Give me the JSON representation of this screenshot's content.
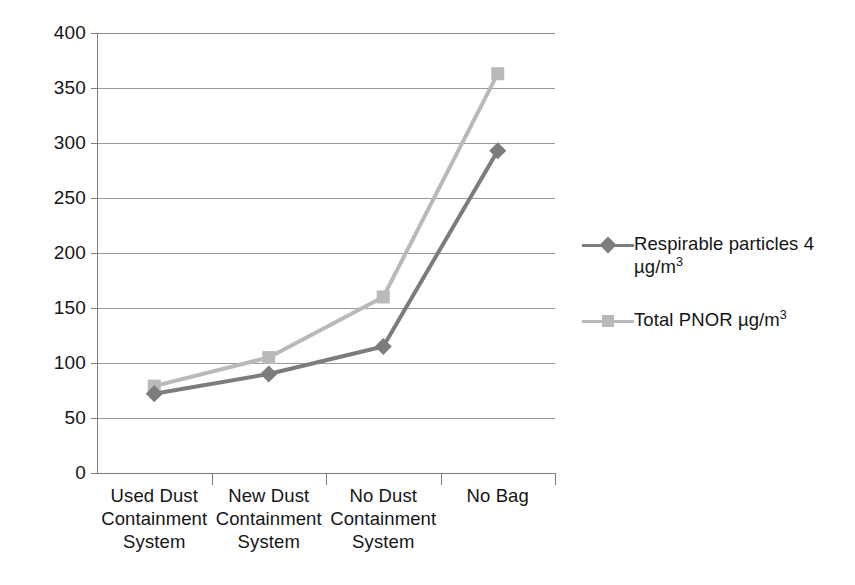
{
  "chart_data": {
    "type": "line",
    "title": "",
    "subtitle": "",
    "xlabel": "",
    "ylabel": "",
    "categories": [
      "Used Dust Containment System",
      "New Dust Containment System",
      "No Dust Containment System",
      "No Bag"
    ],
    "category_lines": [
      [
        "Used Dust",
        "Containment",
        "System"
      ],
      [
        "New Dust",
        "Containment",
        "System"
      ],
      [
        "No Dust",
        "Containment",
        "System"
      ],
      [
        "No Bag",
        "",
        ""
      ]
    ],
    "series": [
      {
        "name": "Respirable particles 4 µg/m³",
        "name_line1": "Respirable particles 4",
        "name_line2_prefix": "µg/m",
        "name_line2_sup": "3",
        "values": [
          72,
          90,
          115,
          293
        ],
        "color": "#7c7c7c",
        "marker": "diamond"
      },
      {
        "name": "Total PNOR µg/m³",
        "name_line1_prefix": "Total PNOR µg/m",
        "name_line1_sup": "3",
        "values": [
          79,
          105,
          160,
          363
        ],
        "color": "#b9b9b9",
        "marker": "square"
      }
    ],
    "ylim": [
      0,
      400
    ],
    "ytick_step": 50,
    "yticks": [
      "0",
      "50",
      "100",
      "150",
      "200",
      "250",
      "300",
      "350",
      "400"
    ],
    "grid": true,
    "legend_position": "right",
    "gridline_color": "#9a9a9a",
    "axis_color": "#7d7d7d",
    "background": "#ffffff"
  }
}
